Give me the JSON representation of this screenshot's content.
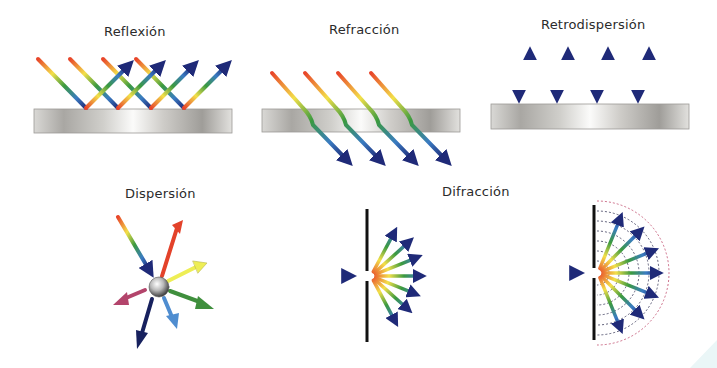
{
  "panels": {
    "reflexion": {
      "label": "Reflexión",
      "beams": 4,
      "surface": "mirror"
    },
    "refraccion": {
      "label": "Refracción",
      "beams": 4,
      "surface": "glass"
    },
    "retrodispersion": {
      "label": "Retrodispersión",
      "beams": 4,
      "surface": "mirror"
    },
    "dispersion": {
      "label": "Dispersión",
      "outgoing_rays": 6,
      "scatterer": "sphere"
    },
    "difraccion": {
      "label": "Difracción",
      "variants": [
        "rays",
        "rays-with-wavefronts"
      ],
      "rays_per_slit": 7
    }
  },
  "colors": {
    "spectrum": [
      "#e8452a",
      "#f7c21f",
      "#f3ee4c",
      "#3b9a3f",
      "#3a7cc2",
      "#1f2a78"
    ],
    "surface_light": "#f7f7f5",
    "surface_dark": "#a9a7a3",
    "barrier": "#111111",
    "wavefront": "#c04d6d"
  },
  "dispersion_rays": [
    {
      "name": "red",
      "color": "#e3422a"
    },
    {
      "name": "yellow",
      "color": "#eeee55"
    },
    {
      "name": "green",
      "color": "#3f8f3d"
    },
    {
      "name": "blue",
      "color": "#4f8dd0"
    },
    {
      "name": "navy",
      "color": "#17215e"
    },
    {
      "name": "magenta",
      "color": "#b3446b"
    }
  ]
}
